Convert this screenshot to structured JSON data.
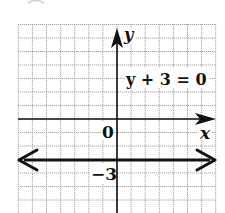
{
  "figure": {
    "equation_label": "y + 3 = 0",
    "x_axis_label": "x",
    "y_axis_label": "y",
    "origin_label": "0",
    "intercept_label": "−3"
  },
  "grid": {
    "x_min": -7,
    "x_max": 7,
    "y_min": -7,
    "y_max": 7,
    "cell_size_px_x": 14.1,
    "cell_size_px_y": 13.5,
    "line_color": "#9a9a9a",
    "axis_color": "#111111"
  },
  "line": {
    "equation": "y = -3",
    "y_value": -3,
    "type": "horizontal",
    "arrows": "both",
    "color": "#111111"
  }
}
